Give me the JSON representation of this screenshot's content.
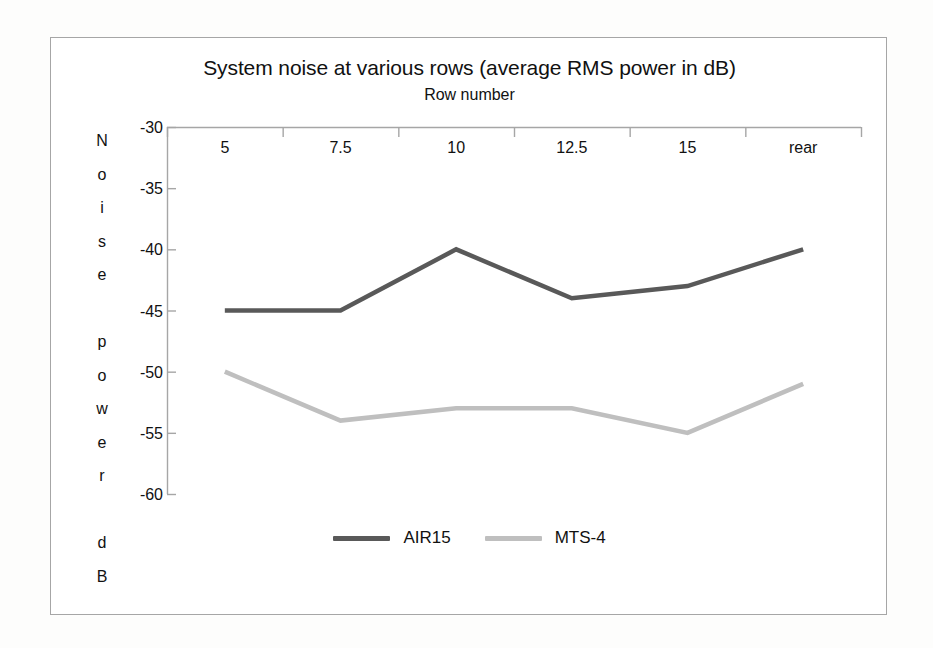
{
  "chart_data": {
    "type": "line",
    "title": "System noise at various rows (average RMS power in dB)",
    "xlabel": "Row number",
    "ylabel": "Noise power dB",
    "categories": [
      "5",
      "7.5",
      "10",
      "12.5",
      "15",
      "rear"
    ],
    "yticks": [
      "-30",
      "-35",
      "-40",
      "-45",
      "-50",
      "-55",
      "-60"
    ],
    "ylim": [
      -60,
      -30
    ],
    "grid": false,
    "legend_position": "bottom",
    "series": [
      {
        "name": "AIR15",
        "color": "#595959",
        "values": [
          -45,
          -45,
          -40,
          -44,
          -43,
          -40
        ]
      },
      {
        "name": "MTS-4",
        "color": "#bfbfbf",
        "values": [
          -50,
          -54,
          -53,
          -53,
          -55,
          -51
        ]
      }
    ]
  }
}
